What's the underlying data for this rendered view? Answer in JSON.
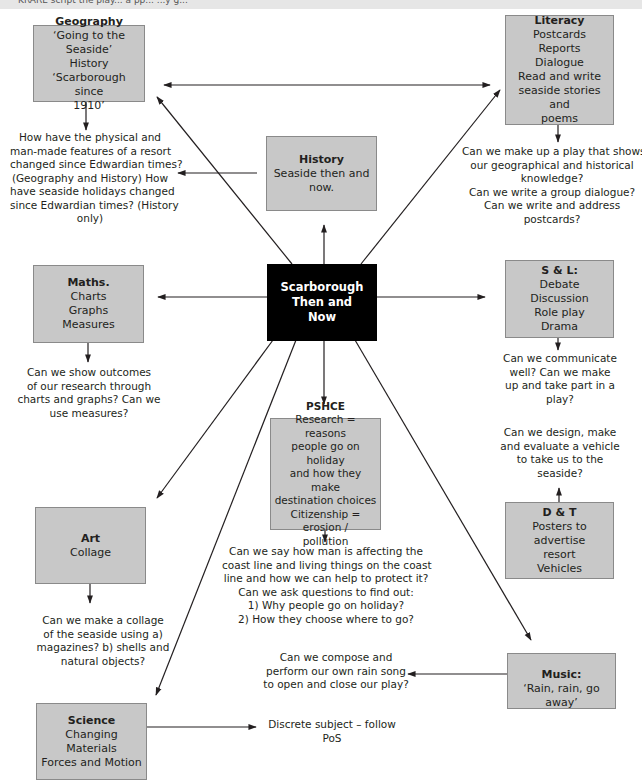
{
  "header_strip": {
    "text": "KRARE script the play... a pp... ...y g..."
  },
  "center": {
    "lines": [
      "Scarborough",
      "Then and",
      "Now"
    ]
  },
  "boxes": {
    "geography": {
      "title": "Geography",
      "lines": [
        "‘Going to the Seaside’",
        "History",
        "‘Scarborough since",
        "1910’"
      ]
    },
    "history": {
      "title": "History",
      "lines": [
        "Seaside then and",
        "now."
      ]
    },
    "literacy": {
      "title": "Literacy",
      "lines": [
        "Postcards",
        "Reports",
        "Dialogue",
        "Read and write",
        "seaside stories and",
        "poems"
      ]
    },
    "maths": {
      "title": "Maths.",
      "lines": [
        "Charts",
        "Graphs",
        "Measures"
      ]
    },
    "sl": {
      "title": "S & L:",
      "lines": [
        "Debate",
        "Discussion",
        "Role play",
        "Drama"
      ]
    },
    "pshce": {
      "title": "PSHCE",
      "lines": [
        "Research = reasons",
        "people go on holiday",
        "and how they make",
        "destination choices",
        "Citizenship = erosion /",
        "pollution"
      ]
    },
    "art": {
      "title": "Art",
      "lines": [
        "Collage"
      ]
    },
    "dt": {
      "title": "D & T",
      "lines": [
        "Posters to advertise",
        "resort",
        "Vehicles"
      ]
    },
    "music": {
      "title": "Music:",
      "lines": [
        "‘Rain, rain, go away’"
      ]
    },
    "science": {
      "title": "Science",
      "lines": [
        "Changing Materials",
        "Forces and Motion"
      ]
    }
  },
  "notes": {
    "geography_history": [
      "How have the physical and",
      "man-made features of a resort",
      "changed since Edwardian times?",
      "(Geography and History)  How",
      "have seaside holidays changed",
      "since Edwardian times? (History",
      "only)"
    ],
    "literacy": [
      "Can we make up a play that shows",
      "our geographical and historical",
      "knowledge?",
      "Can we write a group dialogue?",
      "Can we write and address",
      "postcards?"
    ],
    "maths": [
      "Can we show outcomes",
      "of  our  research through",
      "charts and graphs? Can we",
      "use measures?"
    ],
    "sl": [
      "Can we communicate",
      "well? Can we make",
      "up and take part in a",
      "play?"
    ],
    "dt": [
      "Can we design, make",
      "and evaluate a vehicle",
      "to take us to the",
      "seaside?"
    ],
    "pshce": [
      "Can we say how man is affecting the",
      "coast line and living things on the coast",
      "line and how we can help to protect it?",
      "Can we ask questions to find out:",
      "1) Why people go on holiday?",
      "2) How they choose where to go?"
    ],
    "art": [
      "Can we make a collage",
      "of the seaside using a)",
      "magazines? b) shells and",
      "natural objects?"
    ],
    "music": [
      "Can we compose and",
      "perform our own rain song",
      "to open and close our play?"
    ],
    "science": [
      "Discrete subject – follow",
      "PoS"
    ]
  },
  "colors": {
    "box_fill": "#c8c8c8",
    "box_border": "#8a8a8a",
    "center_fill": "#000000",
    "text": "#231f20",
    "line": "#231f20"
  }
}
